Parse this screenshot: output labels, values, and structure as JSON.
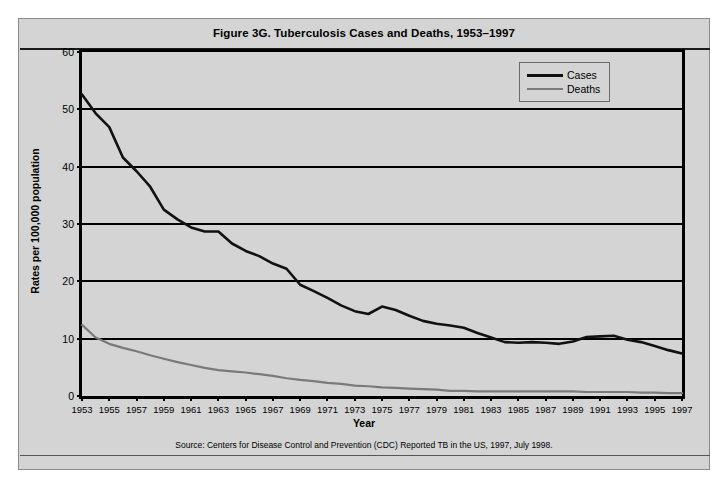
{
  "figure": {
    "title": "Figure 3G. Tuberculosis Cases and Deaths, 1953–1997",
    "source_note": "Source: Centers for Disease Control and Prevention (CDC) Reported TB in the US, 1997, July 1998.",
    "background_color": "#d4d4d4",
    "frame_color": "#8a8a8a"
  },
  "chart_data": {
    "type": "line",
    "title": "Figure 3G. Tuberculosis Cases and Deaths, 1953–1997",
    "xlabel": "Year",
    "ylabel": "Rates per 100,000 population",
    "xlim": [
      1953,
      1997
    ],
    "ylim": [
      0,
      60
    ],
    "ytick_values": [
      0,
      10,
      20,
      30,
      40,
      50,
      60
    ],
    "ytick_labels": [
      "0",
      "10",
      "20",
      "30",
      "40",
      "50",
      "60"
    ],
    "grid": "horizontal",
    "legend_position": "top-right-inside",
    "x": [
      1953,
      1954,
      1955,
      1956,
      1957,
      1958,
      1959,
      1960,
      1961,
      1962,
      1963,
      1964,
      1965,
      1966,
      1967,
      1968,
      1969,
      1970,
      1971,
      1972,
      1973,
      1974,
      1975,
      1976,
      1977,
      1978,
      1979,
      1980,
      1981,
      1982,
      1983,
      1984,
      1985,
      1986,
      1987,
      1988,
      1989,
      1990,
      1991,
      1992,
      1993,
      1994,
      1995,
      1996,
      1997
    ],
    "xtick_labels": [
      "1953",
      "1955",
      "1957",
      "1959",
      "1961",
      "1963",
      "1965",
      "1967",
      "1969",
      "1971",
      "1973",
      "1975",
      "1977",
      "1979",
      "1981",
      "1983",
      "1985",
      "1987",
      "1989",
      "1991",
      "1993",
      "1995",
      "1997"
    ],
    "series": [
      {
        "name": "Cases",
        "color": "#111111",
        "line_width": 2.6,
        "values": [
          52.6,
          49.3,
          46.9,
          41.6,
          39.2,
          36.5,
          32.5,
          30.8,
          29.4,
          28.7,
          28.7,
          26.6,
          25.3,
          24.4,
          23.1,
          22.2,
          19.4,
          18.3,
          17.1,
          15.8,
          14.8,
          14.3,
          15.6,
          15.0,
          14.0,
          13.1,
          12.6,
          12.3,
          11.9,
          11.0,
          10.2,
          9.4,
          9.3,
          9.4,
          9.3,
          9.1,
          9.5,
          10.3,
          10.4,
          10.5,
          9.8,
          9.4,
          8.7,
          8.0,
          7.4
        ]
      },
      {
        "name": "Deaths",
        "color": "#7a7a7a",
        "line_width": 2.2,
        "values": [
          12.4,
          10.2,
          9.1,
          8.4,
          7.8,
          7.1,
          6.5,
          5.9,
          5.4,
          4.9,
          4.5,
          4.3,
          4.1,
          3.8,
          3.5,
          3.1,
          2.8,
          2.6,
          2.3,
          2.1,
          1.8,
          1.7,
          1.5,
          1.4,
          1.3,
          1.2,
          1.1,
          0.9,
          0.9,
          0.8,
          0.8,
          0.8,
          0.8,
          0.8,
          0.8,
          0.8,
          0.8,
          0.7,
          0.7,
          0.7,
          0.7,
          0.6,
          0.6,
          0.5,
          0.5
        ]
      }
    ]
  },
  "legend": {
    "items": [
      {
        "label": "Cases",
        "color": "#111111"
      },
      {
        "label": "Deaths",
        "color": "#7a7a7a"
      }
    ]
  }
}
